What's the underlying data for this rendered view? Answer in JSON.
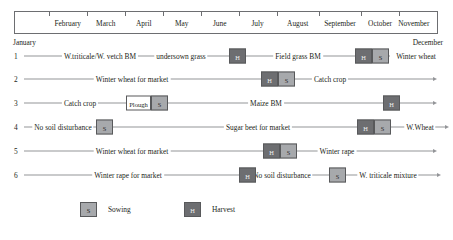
{
  "timeline": {
    "months": [
      {
        "name": "February",
        "center_pct": 12.5
      },
      {
        "name": "March",
        "center_pct": 21.5
      },
      {
        "name": "April",
        "center_pct": 30.5
      },
      {
        "name": "May",
        "center_pct": 39.5
      },
      {
        "name": "June",
        "center_pct": 48.5
      },
      {
        "name": "July",
        "center_pct": 57.5
      },
      {
        "name": "August",
        "center_pct": 67.0
      },
      {
        "name": "September",
        "center_pct": 77.0
      },
      {
        "name": "October",
        "center_pct": 86.5
      },
      {
        "name": "November",
        "center_pct": 94.5
      }
    ],
    "tick_positions_pct": [
      8.0,
      17.0,
      26.0,
      35.0,
      44.0,
      53.0,
      62.0,
      72.0,
      82.0,
      91.0
    ],
    "start_label": "January",
    "end_label": "December"
  },
  "legend": {
    "sowing": {
      "symbol": "S",
      "label": "Sowing",
      "color": "#a7a9ac"
    },
    "harvest": {
      "symbol": "H",
      "label": "Harvest",
      "color": "#6d6e71"
    }
  },
  "rows": [
    {
      "number": "1",
      "labels": [
        {
          "text": "W.triticale/W. vetch BM",
          "x": 100
        },
        {
          "text": "undersown grass",
          "x": 181
        },
        {
          "text": "Field grass BM",
          "x": 298
        },
        {
          "text": "Winter wheat",
          "x": 416
        }
      ],
      "events": [
        {
          "type": "H",
          "symbol": "H",
          "x": 229
        },
        {
          "type": "H",
          "symbol": "H",
          "x": 355
        },
        {
          "type": "S",
          "symbol": "S",
          "x": 372
        }
      ],
      "line_start": 24,
      "line_end": 390,
      "arrow": false
    },
    {
      "number": "2",
      "labels": [
        {
          "text": "Winter wheat for market",
          "x": 132
        },
        {
          "text": "Catch crop",
          "x": 330
        }
      ],
      "events": [
        {
          "type": "H",
          "symbol": "H",
          "x": 261
        },
        {
          "type": "S",
          "symbol": "S",
          "x": 278
        }
      ],
      "line_start": 24,
      "line_end": 433,
      "arrow": true
    },
    {
      "number": "3",
      "labels": [
        {
          "text": "Catch crop",
          "x": 80
        },
        {
          "text": "Maize BM",
          "x": 266
        }
      ],
      "events": [
        {
          "type": "PLOUGH",
          "symbol": "Plough",
          "x": 126
        },
        {
          "type": "S",
          "symbol": "S",
          "x": 151
        },
        {
          "type": "H",
          "symbol": "H",
          "x": 383
        }
      ],
      "line_start": 24,
      "line_end": 433,
      "arrow": true
    },
    {
      "number": "4",
      "labels": [
        {
          "text": "No soil disturbance",
          "x": 63
        },
        {
          "text": "Sugar beet for market",
          "x": 258
        },
        {
          "text": "W.Wheat",
          "x": 420
        }
      ],
      "events": [
        {
          "type": "S",
          "symbol": "S",
          "x": 96
        },
        {
          "type": "H",
          "symbol": "H",
          "x": 357
        },
        {
          "type": "S",
          "symbol": "S",
          "x": 374
        }
      ],
      "line_start": 24,
      "line_end": 445,
      "arrow": true
    },
    {
      "number": "5",
      "labels": [
        {
          "text": "Winter wheat for market",
          "x": 132
        },
        {
          "text": "Winter rape",
          "x": 337
        }
      ],
      "events": [
        {
          "type": "H",
          "symbol": "H",
          "x": 263
        },
        {
          "type": "S",
          "symbol": "S",
          "x": 280
        }
      ],
      "line_start": 24,
      "line_end": 433,
      "arrow": true
    },
    {
      "number": "6",
      "labels": [
        {
          "text": "Winter rape for market",
          "x": 128
        },
        {
          "text": "No soil disturbance",
          "x": 282
        },
        {
          "text": "W. triticale mixture",
          "x": 388
        }
      ],
      "events": [
        {
          "type": "H",
          "symbol": "H",
          "x": 239
        },
        {
          "type": "S",
          "symbol": "S",
          "x": 329
        }
      ],
      "line_start": 24,
      "line_end": 437,
      "arrow": true
    }
  ]
}
